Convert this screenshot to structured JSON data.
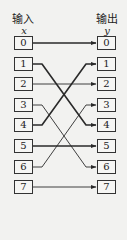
{
  "diagram": {
    "input_header": "输入",
    "output_header": "输出",
    "input_var": "x",
    "output_var": "y",
    "inputs": [
      "0",
      "1",
      "2",
      "3",
      "4",
      "5",
      "6",
      "7"
    ],
    "outputs": [
      "0",
      "1",
      "2",
      "3",
      "4",
      "5",
      "6",
      "7"
    ],
    "mapping": [
      {
        "from": 0,
        "to": 0,
        "weight": "thick"
      },
      {
        "from": 1,
        "to": 4,
        "weight": "thick"
      },
      {
        "from": 2,
        "to": 2,
        "weight": "thin"
      },
      {
        "from": 3,
        "to": 6,
        "weight": "thin"
      },
      {
        "from": 4,
        "to": 1,
        "weight": "thick"
      },
      {
        "from": 5,
        "to": 5,
        "weight": "thick"
      },
      {
        "from": 6,
        "to": 3,
        "weight": "thin"
      },
      {
        "from": 7,
        "to": 7,
        "weight": "thin"
      }
    ],
    "line_color": "#2a2a2a",
    "box_border_color": "#333333",
    "background_color": "#f2f2f0"
  }
}
